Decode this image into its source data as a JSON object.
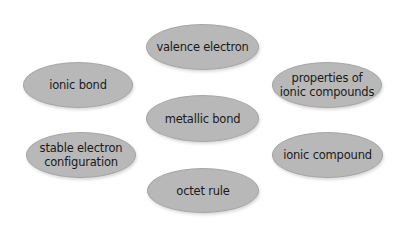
{
  "diagram": {
    "type": "vocabulary-bubbles",
    "nodes": [
      {
        "id": "valence-electron",
        "label": "valence electron"
      },
      {
        "id": "ionic-bond",
        "label": "ionic bond"
      },
      {
        "id": "properties-of-ionic-compounds",
        "label": "properties of\nionic compounds"
      },
      {
        "id": "metallic-bond",
        "label": "metallic bond"
      },
      {
        "id": "stable-electron-configuration",
        "label": "stable electron\nconfiguration"
      },
      {
        "id": "ionic-compound",
        "label": "ionic compound"
      },
      {
        "id": "octet-rule",
        "label": "octet rule"
      }
    ],
    "colors": {
      "fill": "#b8b8b8",
      "border": "#a6a6a6",
      "text": "#1a1a1a",
      "background": "#ffffff"
    }
  }
}
